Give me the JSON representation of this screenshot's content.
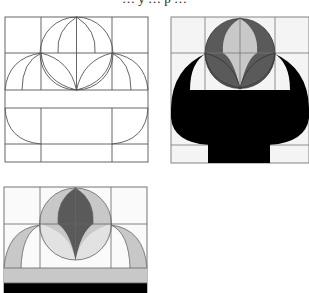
{
  "caption": "… y … p …",
  "colors": {
    "line": "#555555",
    "background": "#ffffff",
    "cell_light": "#f4f4f4",
    "light_gray": "#c8c8c8",
    "dark_gray": "#5a5a5a",
    "black": "#000000"
  },
  "panels": [
    {
      "id": "construction-grid",
      "description": "Line construction: 3x5 grid with central circle, lens arcs, side arcs and basket outline"
    },
    {
      "id": "filled-basket",
      "description": "Filled design: dark gray circle with light gray lens shapes above black basket"
    },
    {
      "id": "filled-tiara",
      "description": "Filled design variant: light gray circle with dark gray center lens, side arcs in light gray, gray band and black band"
    }
  ]
}
